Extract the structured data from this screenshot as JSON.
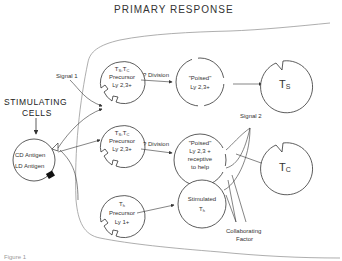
{
  "title": "PRIMARY RESPONSE",
  "stimulating_cells": {
    "label_line1": "STIMULATING",
    "label_line2": "CELLS",
    "cd_antigen": "CD Antigen",
    "ld_antigen": "LD Antigen"
  },
  "signals": {
    "signal1": "Signal 1",
    "signal2": "Signal 2",
    "collaborating_line1": "Collaborating",
    "collaborating_line2": "Factor"
  },
  "arrows": {
    "division1": "? Division",
    "division2": "? Division"
  },
  "precursors": [
    {
      "name": "Ts,Tc",
      "main": "T",
      "sub1": "S",
      "sep": ",T",
      "sub2": "C",
      "line2": "Precursor",
      "line3": "Ly 2,3+"
    },
    {
      "name": "Ts,Tc",
      "main": "T",
      "sub1": "S",
      "sep": ",T",
      "sub2": "C",
      "line2": "Precursor",
      "line3": "Ly 2,3+"
    },
    {
      "name": "Th",
      "main": "T",
      "sub1": "h",
      "line2": "Precursor",
      "line3": "Ly 1+"
    }
  ],
  "poised": [
    {
      "line1": "\"Poised\"",
      "line2": "Ly 2,3+"
    },
    {
      "line1": "\"Poised\"",
      "line2": "Ly 2,3 +",
      "line3": "receptive",
      "line4": "to help"
    }
  ],
  "stimulated": {
    "line1": "Stimulated",
    "main": "T",
    "sub": "h"
  },
  "effectors": [
    {
      "main": "T",
      "sub": "S"
    },
    {
      "main": "T",
      "sub": "C"
    }
  ],
  "figure_caption": "Figure 1"
}
